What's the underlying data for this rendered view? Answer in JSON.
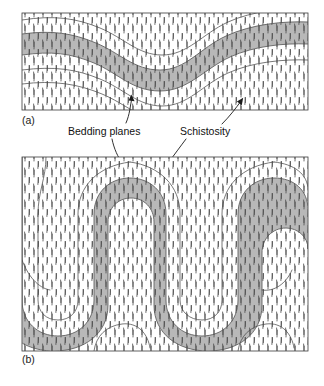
{
  "figure": {
    "type": "geological-cross-section-diagram",
    "background_color": "#ffffff",
    "panels": [
      {
        "id": "a",
        "label": "(a)",
        "label_x": 22,
        "label_y": 118,
        "frame": {
          "x": 22,
          "y": 13,
          "width": 286,
          "height": 97
        },
        "fold_style": "open sinusoidal fold",
        "description": "Gently folded bed with near-vertical schistosity cutting across it"
      },
      {
        "id": "b",
        "label": "(b)",
        "label_x": 22,
        "label_y": 357,
        "frame": {
          "x": 22,
          "y": 157,
          "width": 286,
          "height": 194
        },
        "fold_style": "tight isoclinal fold",
        "description": "Tightly folded bed forming serpentine hinges with axial-planar schistosity"
      }
    ],
    "annotations": [
      {
        "name": "bedding-planes",
        "text": "Bedding planes",
        "text_x": 68,
        "text_y": 135,
        "leaders": [
          {
            "to_panel": "a",
            "target_x": 131,
            "target_y": 96
          },
          {
            "to_panel": "b",
            "target_x": 123,
            "target_y": 166
          }
        ]
      },
      {
        "name": "schistosity",
        "text": "Schistosity",
        "text_x": 180,
        "text_y": 135,
        "leaders": [
          {
            "to_panel": "a",
            "target_x": 243,
            "target_y": 98
          },
          {
            "to_panel": "b",
            "target_x": 166,
            "target_y": 166
          }
        ]
      }
    ],
    "colors": {
      "bed_fill": "#b8b8b8",
      "bed_outline": "#5a5a5a",
      "matrix_fill": "#ffffff",
      "schistosity_dash": "#4a4a4a",
      "marker_line": "#4b4b4b",
      "frame_stroke": "#3a3a3a",
      "text": "#111111"
    },
    "schistosity": {
      "style": "short near-vertical dashes",
      "orientation_degrees": 90,
      "description": "Pervasive steeply-dipping cleavage shown as short vertical tick marks"
    }
  }
}
